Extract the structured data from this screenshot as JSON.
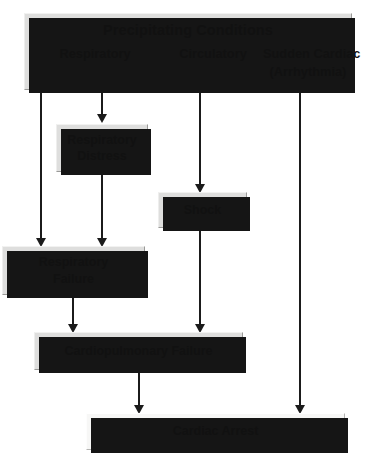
{
  "diagram": {
    "type": "flowchart",
    "title": "Precipitating Conditions",
    "orientation": "top-to-bottom",
    "colors": {
      "box_fill": "#dededd",
      "box_fill_light": "#f7f7f6",
      "box_border": "#9a9a98",
      "shadow": "#151515",
      "connector": "#1b1b1b",
      "text": "#111111",
      "background": "#ffffff"
    },
    "header": {
      "title": "Precipitating Conditions",
      "columns": [
        {
          "id": "respiratory",
          "label": "Respiratory"
        },
        {
          "id": "circulatory",
          "label": "Circulatory"
        },
        {
          "id": "cardiac",
          "label_line1": "Sudden Cardiac",
          "label_line2": "(Arrhythmia)"
        }
      ]
    },
    "nodes": [
      {
        "id": "respiratory-distress",
        "line1": "Respiratory",
        "line2": "Distress"
      },
      {
        "id": "shock",
        "line1": "Shock",
        "line2": ""
      },
      {
        "id": "respiratory-failure",
        "line1": "Respiratory",
        "line2": "Failure"
      },
      {
        "id": "cardiopulmonary-failure",
        "line1": "Cardiopulmonary Failure",
        "line2": ""
      },
      {
        "id": "cardiac-arrest",
        "line1": "Cardiac Arrest",
        "line2": ""
      }
    ],
    "edges": [
      {
        "from": "precipitating-conditions",
        "to": "respiratory-failure",
        "column": "respiratory"
      },
      {
        "from": "precipitating-conditions",
        "to": "respiratory-distress",
        "column": "respiratory"
      },
      {
        "from": "precipitating-conditions",
        "to": "shock",
        "column": "circulatory"
      },
      {
        "from": "precipitating-conditions",
        "to": "cardiac-arrest",
        "column": "cardiac"
      },
      {
        "from": "respiratory-distress",
        "to": "respiratory-failure",
        "column": "respiratory"
      },
      {
        "from": "respiratory-failure",
        "to": "cardiopulmonary-failure",
        "column": "respiratory"
      },
      {
        "from": "shock",
        "to": "cardiopulmonary-failure",
        "column": "circulatory"
      },
      {
        "from": "cardiopulmonary-failure",
        "to": "cardiac-arrest",
        "column": "respiratory"
      }
    ]
  }
}
